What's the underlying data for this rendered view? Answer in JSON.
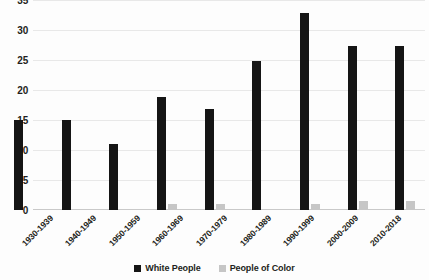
{
  "chart_data": {
    "type": "bar",
    "title": "",
    "xlabel": "",
    "ylabel": "",
    "ylim": [
      0,
      35
    ],
    "ytick_step": 5,
    "yticks": [
      "0",
      "5",
      "10",
      "15",
      "20",
      "25",
      "30",
      "35"
    ],
    "grid": true,
    "legend_position": "bottom-center",
    "categories": [
      "1930-1939",
      "1940-1949",
      "1950-1959",
      "1960-1969",
      "1970-1979",
      "1980-1989",
      "1990-1999",
      "2000-2009",
      "2010-2018"
    ],
    "series": [
      {
        "name": "White People",
        "color": "#151515",
        "values": [
          15,
          15,
          11,
          19,
          17,
          25,
          33,
          27.5,
          27.5
        ]
      },
      {
        "name": "People of Color",
        "color": "#c6c6c6",
        "values": [
          0,
          0,
          0,
          1,
          1,
          0,
          1,
          1.5,
          1.5
        ]
      }
    ]
  },
  "legend": {
    "items": [
      {
        "label": "White People",
        "color": "#151515"
      },
      {
        "label": "People of Color",
        "color": "#c6c6c6"
      }
    ]
  }
}
